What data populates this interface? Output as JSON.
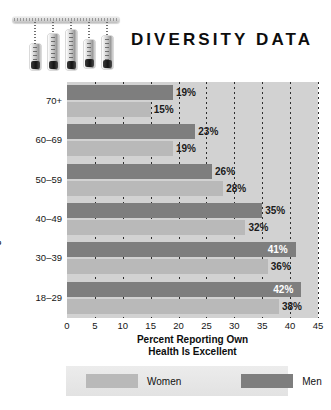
{
  "title": "DIVERSITY DATA",
  "decoration": {
    "name": "thermometer-cluster",
    "count": 5
  },
  "chart_data": {
    "type": "bar",
    "orientation": "horizontal",
    "title": "DIVERSITY DATA",
    "xlabel": "Percent Reporting Own Health Is Excellent",
    "xlabel_line1": "Percent Reporting Own",
    "xlabel_line2": "Health Is Excellent",
    "ylabel": "Age",
    "categories": [
      "70+",
      "60–69",
      "50–59",
      "40–49",
      "30–39",
      "18–29"
    ],
    "series": [
      {
        "name": "Men",
        "color": "#7e7e7e",
        "values": [
          19,
          23,
          26,
          35,
          41,
          42
        ],
        "labels": [
          "19%",
          "23%",
          "26%",
          "35%",
          "41%",
          "42%"
        ],
        "label_inside": [
          false,
          false,
          false,
          false,
          true,
          true
        ]
      },
      {
        "name": "Women",
        "color": "#b9b9b9",
        "values": [
          15,
          19,
          28,
          32,
          36,
          38
        ],
        "labels": [
          "15%",
          "19%",
          "28%",
          "32%",
          "36%",
          "38%"
        ],
        "label_inside": [
          false,
          false,
          false,
          false,
          false,
          false
        ]
      }
    ],
    "xlim": [
      0,
      45
    ],
    "xticks": [
      0,
      5,
      10,
      15,
      20,
      25,
      30,
      35,
      40,
      45
    ],
    "xtick_labels": [
      "0",
      "5",
      "10",
      "15",
      "20",
      "25",
      "30",
      "35",
      "40",
      "45"
    ],
    "grid": true,
    "grid_style": "dotted-vertical",
    "legend_position": "bottom",
    "plot_background": "#d2d2d2"
  },
  "legend": {
    "items": [
      {
        "label": "Women",
        "color": "#b9b9b9"
      },
      {
        "label": "Men",
        "color": "#7e7e7e"
      }
    ]
  }
}
